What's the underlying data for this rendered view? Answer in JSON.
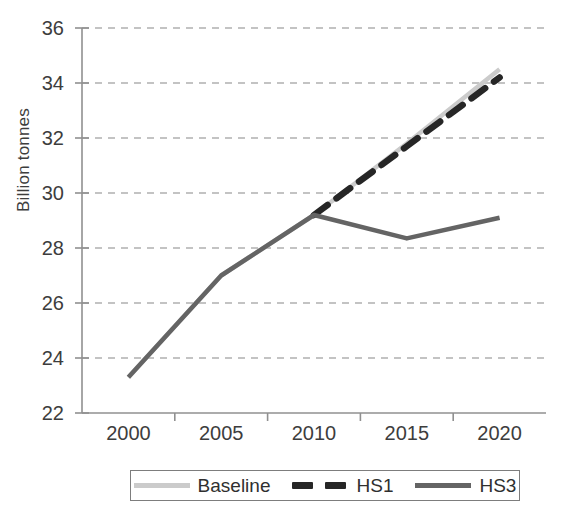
{
  "chart_data": {
    "type": "line",
    "title": "",
    "xlabel": "",
    "ylabel": "Billion tonnes",
    "ylim": [
      22,
      36
    ],
    "yticks": [
      22,
      24,
      26,
      28,
      30,
      32,
      34,
      36
    ],
    "grid": true,
    "legend_position": "bottom",
    "x": [
      2000,
      2005,
      2010,
      2015,
      2020
    ],
    "categories": [
      "2000",
      "2005",
      "2010",
      "2015",
      "2020"
    ],
    "series": [
      {
        "name": "Baseline",
        "color": "#cbcbcb",
        "style": "solid",
        "x": [
          2000,
          2005,
          2010,
          2015,
          2020
        ],
        "values": [
          23.3,
          27.0,
          29.2,
          31.8,
          34.5
        ]
      },
      {
        "name": "HS1",
        "color": "#262626",
        "style": "dashed",
        "x": [
          2010,
          2015,
          2020
        ],
        "values": [
          29.2,
          31.7,
          34.2
        ]
      },
      {
        "name": "HS3",
        "color": "#646464",
        "style": "solid",
        "x": [
          2000,
          2005,
          2010,
          2015,
          2020
        ],
        "values": [
          23.3,
          27.0,
          29.2,
          28.35,
          29.1
        ]
      }
    ]
  },
  "axis": {
    "y_title": "Billion tonnes",
    "y_labels": [
      "36",
      "34",
      "32",
      "30",
      "28",
      "26",
      "24",
      "22"
    ],
    "x_labels": [
      "2000",
      "2005",
      "2010",
      "2015",
      "2020"
    ]
  },
  "legend": {
    "items": [
      {
        "label": "Baseline",
        "swatch": "solid-light"
      },
      {
        "label": "HS1",
        "swatch": "dashed-dark"
      },
      {
        "label": "HS3",
        "swatch": "solid-mid"
      }
    ]
  }
}
